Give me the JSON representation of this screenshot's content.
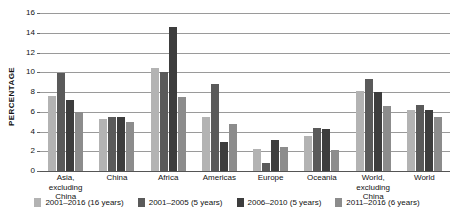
{
  "chart_data": {
    "type": "bar",
    "title": "",
    "xlabel": "",
    "ylabel": "PERCENTAGE",
    "ylim": [
      0,
      16
    ],
    "ytick_step": 2,
    "yticks": [
      16,
      14,
      12,
      10,
      8,
      6,
      4,
      2,
      0
    ],
    "grid": true,
    "legend_position": "bottom",
    "categories": [
      "Asia, excluding China",
      "China",
      "Africa",
      "Americas",
      "Europe",
      "Oceania",
      "World, excluding China",
      "World"
    ],
    "series": [
      {
        "name": "2001–2016 (16 years)",
        "color": "#b3b3b3",
        "values": [
          7.6,
          5.3,
          10.4,
          5.5,
          2.2,
          3.5,
          8.1,
          6.2
        ]
      },
      {
        "name": "2001–2005 (5 years)",
        "color": "#5a5a5a",
        "values": [
          9.9,
          5.5,
          10.0,
          8.8,
          0.8,
          4.4,
          9.3,
          6.7
        ]
      },
      {
        "name": "2006–2010 (5 years)",
        "color": "#3d3d3d",
        "values": [
          7.2,
          5.5,
          14.6,
          2.9,
          3.1,
          4.3,
          8.0,
          6.2
        ]
      },
      {
        "name": "2011–2016 (6 years)",
        "color": "#8c8c8c",
        "values": [
          6.0,
          5.0,
          7.5,
          4.8,
          2.4,
          2.1,
          6.6,
          5.5
        ]
      }
    ]
  }
}
